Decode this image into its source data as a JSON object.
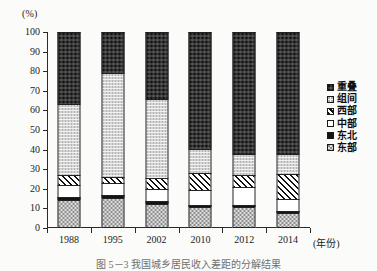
{
  "figure": {
    "yaxis_unit_label": "(%)",
    "xaxis_title": "(年份)",
    "caption": "图 5－3  我国城乡居民收入差距的分解结果"
  },
  "legend": {
    "position": "right",
    "items": [
      {
        "label": "重叠",
        "key": "chongdie",
        "swatch": "dark-dotted"
      },
      {
        "label": "组间",
        "key": "zujian",
        "swatch": "light-dotted"
      },
      {
        "label": "西部",
        "key": "xibu",
        "swatch": "diagonal-hatch"
      },
      {
        "label": "中部",
        "key": "zhongbu",
        "swatch": "white"
      },
      {
        "label": "东北",
        "key": "dongbei",
        "swatch": "solid-black"
      },
      {
        "label": "东部",
        "key": "dongbu",
        "swatch": "medium-dotted"
      }
    ]
  },
  "chart_data": {
    "type": "bar",
    "stacked": true,
    "title": "",
    "xlabel": "(年份)",
    "ylabel": "(%)",
    "ylim": [
      0,
      100
    ],
    "yticks": [
      0,
      10,
      20,
      30,
      40,
      50,
      60,
      70,
      80,
      90,
      100
    ],
    "grid": false,
    "categories": [
      "1988",
      "1995",
      "2002",
      "2010",
      "2012",
      "2014"
    ],
    "series": [
      {
        "name": "东部",
        "key": "dongbu",
        "values": [
          14.5,
          15.5,
          12.5,
          10.5,
          10.5,
          7.5
        ]
      },
      {
        "name": "东北",
        "key": "dongbei",
        "values": [
          1.5,
          1.5,
          1.5,
          1.0,
          1.0,
          1.0
        ]
      },
      {
        "name": "中部",
        "key": "zhongbu",
        "values": [
          6.0,
          6.0,
          6.0,
          8.0,
          9.5,
          6.5
        ]
      },
      {
        "name": "西部",
        "key": "xibu",
        "values": [
          5.0,
          3.0,
          5.5,
          8.5,
          6.0,
          12.5
        ]
      },
      {
        "name": "组间",
        "key": "zujian",
        "values": [
          36.5,
          53.0,
          40.5,
          12.5,
          11.0,
          10.5
        ]
      },
      {
        "name": "重叠",
        "key": "chongdie",
        "values": [
          36.5,
          21.0,
          34.0,
          59.5,
          62.0,
          62.0
        ]
      }
    ]
  }
}
